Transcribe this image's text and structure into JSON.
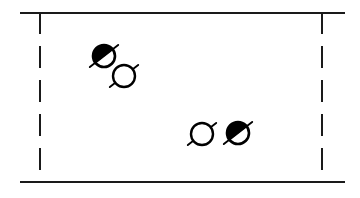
{
  "figure": {
    "title": "",
    "caption": "",
    "width": 360,
    "height": 198,
    "background_color": "#ffffff",
    "ink_color": "#000000"
  },
  "diagram_data": {
    "type": "schematic",
    "description": "Hand-drawn style schematic: a rectangular cell with solid top and bottom walls and dashed left and right walls, containing four small circular particles each crossed by a short diagonal director line. Two particles are filled (black) and two are open (white).",
    "cell": {
      "label": "simulation-box",
      "top_wall": {
        "style": "solid",
        "x1": 20,
        "x2": 345,
        "y": 13,
        "stroke_width": 2.0
      },
      "bottom_wall": {
        "style": "solid",
        "x1": 20,
        "x2": 345,
        "y": 182,
        "stroke_width": 2.0
      },
      "left_wall": {
        "style": "dashed",
        "x": 40,
        "y1": 13,
        "y2": 182,
        "stroke_width": 2.0,
        "dash_count": 5,
        "dash": 22,
        "gap": 12
      },
      "right_wall": {
        "style": "dashed",
        "x": 322,
        "y1": 13,
        "y2": 182,
        "stroke_width": 2.0,
        "dash_count": 5,
        "dash": 22,
        "gap": 12
      }
    },
    "particles": [
      {
        "id": "particle-1",
        "fill": "filled",
        "fill_color": "#000000",
        "cx": 104,
        "cy": 56,
        "r": 11,
        "director_angle_deg": -38,
        "director_length": 36,
        "hemisphere_angle_deg": -38
      },
      {
        "id": "particle-2",
        "fill": "open",
        "fill_color": "#ffffff",
        "cx": 124,
        "cy": 76,
        "r": 11,
        "director_angle_deg": -38,
        "director_length": 36,
        "hemisphere_angle_deg": null
      },
      {
        "id": "particle-3",
        "fill": "open",
        "fill_color": "#ffffff",
        "cx": 202,
        "cy": 134,
        "r": 11,
        "director_angle_deg": -38,
        "director_length": 36,
        "hemisphere_angle_deg": null
      },
      {
        "id": "particle-4",
        "fill": "filled",
        "fill_color": "#000000",
        "cx": 238,
        "cy": 133,
        "r": 11,
        "director_angle_deg": -38,
        "director_length": 36,
        "hemisphere_angle_deg": -38
      }
    ],
    "counts": {
      "filled_particles": 2,
      "open_particles": 2,
      "total_particles": 4
    },
    "legend": [],
    "annotations": [],
    "axis_labels": []
  }
}
